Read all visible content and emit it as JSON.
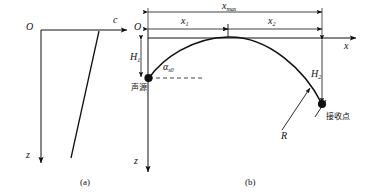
{
  "figure": {
    "type": "ray-path-diagram",
    "panels": [
      {
        "id": "a",
        "caption": "(a)",
        "origin_label": "O",
        "horizontal_axis_label": "c",
        "vertical_axis_label": "z",
        "description": "sound speed profile c(z) increasing linearly with depth"
      },
      {
        "id": "b",
        "caption": "(b)",
        "origin_label": "O",
        "horizontal_axis_label": "x",
        "vertical_axis_label": "z",
        "dimensions": {
          "total_range": "x",
          "total_range_sub": "max",
          "first_leg": "x",
          "first_leg_sub": "1",
          "second_leg": "x",
          "second_leg_sub": "2",
          "source_depth": "H",
          "source_depth_sub": "1",
          "receiver_depth": "H",
          "receiver_depth_sub": "2",
          "radius": "R"
        },
        "angle": {
          "symbol": "α",
          "subscript": "s0"
        },
        "points": [
          {
            "name": "source",
            "label": "声源"
          },
          {
            "name": "receiver",
            "label": "接收点"
          }
        ]
      }
    ],
    "colors": {
      "stroke": "#111111",
      "text": "#111111",
      "background": "#ffffff"
    }
  }
}
